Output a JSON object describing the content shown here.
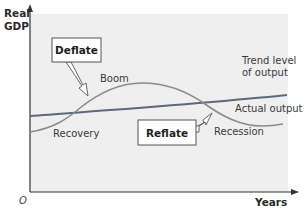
{
  "axes": {
    "y_label_line1": "Real",
    "y_label_line2": "GDP",
    "x_label": "Years",
    "origin": "O"
  },
  "curves": {
    "trend_label_line1": "Trend level",
    "trend_label_line2": "of output",
    "actual_label": "Actual output"
  },
  "phases": {
    "boom": "Boom",
    "recovery": "Recovery",
    "recession": "Recession"
  },
  "policies": {
    "deflate": "Deflate",
    "reflate": "Reflate"
  },
  "colors": {
    "plot_background": "#efefef",
    "trend_line": "#5a6a7a",
    "actual_curve": "#8c8c8c",
    "axis": "#333333"
  }
}
